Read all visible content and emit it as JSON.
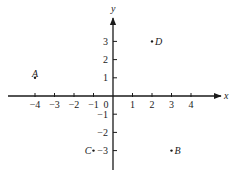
{
  "chart_data": {
    "type": "scatter",
    "title": "",
    "xlabel": "x",
    "ylabel": "y",
    "xlim": [
      -4.5,
      5
    ],
    "ylim": [
      -4,
      4
    ],
    "grid": false,
    "legend": "none",
    "x_ticks": [
      -4,
      -3,
      -2,
      -1,
      0,
      1,
      2,
      3,
      4
    ],
    "x_tick_labels": [
      "−4",
      "−3",
      "−2",
      "−1",
      "0",
      "1",
      "2",
      "3",
      "4"
    ],
    "y_ticks": [
      3,
      2,
      1,
      -1,
      -2,
      -3
    ],
    "y_tick_labels": [
      "3",
      "2",
      "1",
      "−1",
      "−2",
      "−3"
    ],
    "points": [
      {
        "label": "A",
        "x": -4,
        "y": 1
      },
      {
        "label": "B",
        "x": 3,
        "y": -3
      },
      {
        "label": "C",
        "x": -1,
        "y": -3
      },
      {
        "label": "D",
        "x": 2,
        "y": 3
      }
    ]
  },
  "colors": {
    "ink": "#1a1a1a",
    "background": "#ffffff"
  }
}
